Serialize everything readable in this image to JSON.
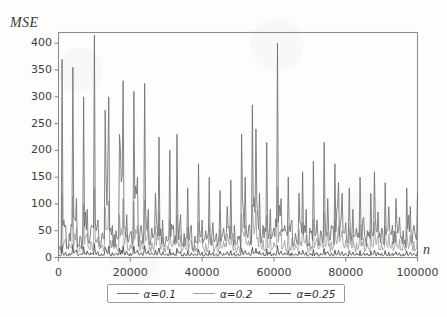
{
  "chart_data": {
    "type": "line",
    "title": "",
    "subtitle": "",
    "xlabel": "n",
    "ylabel": "MSE",
    "xlim": [
      0,
      100000
    ],
    "ylim": [
      0,
      420
    ],
    "grid": false,
    "legend_position": "below-axes",
    "xticks": [
      0,
      20000,
      40000,
      60000,
      80000,
      100000
    ],
    "xtick_labels": [
      "0",
      "20000",
      "40000",
      "60000",
      "80000",
      "100000"
    ],
    "yticks": [
      0,
      50,
      100,
      150,
      200,
      250,
      300,
      350,
      400
    ],
    "ytick_labels": [
      "0",
      "50",
      "100",
      "150",
      "200",
      "250",
      "300",
      "350",
      "400"
    ],
    "series": [
      {
        "name": "α=0.1",
        "color": "#6f6f6f",
        "x": [
          0,
          1000,
          2000,
          3000,
          4000,
          5000,
          6000,
          7000,
          8000,
          9000,
          10000,
          11000,
          12000,
          13000,
          14000,
          15000,
          16000,
          17000,
          18000,
          19000,
          20000,
          21000,
          22000,
          23000,
          24000,
          25000,
          26000,
          27000,
          28000,
          29000,
          30000,
          31000,
          32000,
          33000,
          34000,
          35000,
          36000,
          37000,
          38000,
          39000,
          40000,
          41000,
          42000,
          43000,
          44000,
          45000,
          46000,
          47000,
          48000,
          49000,
          50000,
          51000,
          52000,
          53000,
          54000,
          55000,
          56000,
          57000,
          58000,
          59000,
          60000,
          61000,
          62000,
          63000,
          64000,
          65000,
          66000,
          67000,
          68000,
          69000,
          70000,
          71000,
          72000,
          73000,
          74000,
          75000,
          76000,
          77000,
          78000,
          79000,
          80000,
          81000,
          82000,
          83000,
          84000,
          85000,
          86000,
          87000,
          88000,
          89000,
          90000,
          91000,
          92000,
          93000,
          94000,
          95000,
          96000,
          97000,
          98000,
          99000,
          100000
        ],
        "values": [
          20,
          370,
          60,
          45,
          355,
          110,
          40,
          300,
          90,
          55,
          415,
          70,
          40,
          275,
          300,
          60,
          50,
          230,
          330,
          80,
          45,
          310,
          150,
          60,
          325,
          90,
          55,
          120,
          225,
          70,
          40,
          200,
          60,
          230,
          80,
          45,
          130,
          60,
          40,
          175,
          70,
          50,
          150,
          65,
          45,
          125,
          55,
          95,
          145,
          60,
          40,
          230,
          150,
          60,
          285,
          240,
          120,
          60,
          215,
          90,
          55,
          400,
          110,
          60,
          150,
          70,
          45,
          120,
          160,
          90,
          55,
          180,
          70,
          50,
          215,
          110,
          60,
          175,
          140,
          120,
          65,
          130,
          90,
          55,
          150,
          75,
          50,
          120,
          160,
          85,
          55,
          140,
          95,
          60,
          110,
          75,
          50,
          130,
          95,
          60,
          120
        ]
      },
      {
        "name": "α=0.2",
        "color": "#a0a0a0",
        "x": [
          0,
          1000,
          2000,
          3000,
          4000,
          5000,
          6000,
          7000,
          8000,
          9000,
          10000,
          11000,
          12000,
          13000,
          14000,
          15000,
          16000,
          17000,
          18000,
          19000,
          20000,
          21000,
          22000,
          23000,
          24000,
          25000,
          26000,
          27000,
          28000,
          29000,
          30000,
          31000,
          32000,
          33000,
          34000,
          35000,
          36000,
          37000,
          38000,
          39000,
          40000,
          41000,
          42000,
          43000,
          44000,
          45000,
          46000,
          47000,
          48000,
          49000,
          50000,
          51000,
          52000,
          53000,
          54000,
          55000,
          56000,
          57000,
          58000,
          59000,
          60000,
          61000,
          62000,
          63000,
          64000,
          65000,
          66000,
          67000,
          68000,
          69000,
          70000,
          71000,
          72000,
          73000,
          74000,
          75000,
          76000,
          77000,
          78000,
          79000,
          80000,
          81000,
          82000,
          83000,
          84000,
          85000,
          86000,
          87000,
          88000,
          89000,
          90000,
          91000,
          92000,
          93000,
          94000,
          95000,
          96000,
          97000,
          98000,
          99000,
          100000
        ],
        "values": [
          10,
          120,
          35,
          25,
          115,
          55,
          22,
          100,
          45,
          30,
          130,
          38,
          22,
          95,
          105,
          32,
          26,
          80,
          110,
          42,
          24,
          105,
          60,
          32,
          108,
          48,
          28,
          58,
          85,
          38,
          22,
          72,
          32,
          80,
          42,
          25,
          58,
          32,
          22,
          66,
          36,
          26,
          60,
          34,
          24,
          52,
          30,
          44,
          58,
          32,
          22,
          82,
          60,
          32,
          98,
          86,
          52,
          32,
          78,
          44,
          28,
          132,
          52,
          32,
          60,
          36,
          24,
          52,
          66,
          42,
          28,
          72,
          36,
          26,
          84,
          48,
          30,
          70,
          58,
          50,
          32,
          56,
          42,
          28,
          62,
          36,
          26,
          52,
          66,
          40,
          28,
          58,
          44,
          30,
          48,
          34,
          26,
          54,
          42,
          30,
          50
        ]
      },
      {
        "name": "α=0.25",
        "color": "#4d4d4d",
        "x": [
          0,
          1000,
          2000,
          3000,
          4000,
          5000,
          6000,
          7000,
          8000,
          9000,
          10000,
          11000,
          12000,
          13000,
          14000,
          15000,
          16000,
          17000,
          18000,
          19000,
          20000,
          21000,
          22000,
          23000,
          24000,
          25000,
          26000,
          27000,
          28000,
          29000,
          30000,
          31000,
          32000,
          33000,
          34000,
          35000,
          36000,
          37000,
          38000,
          39000,
          40000,
          41000,
          42000,
          43000,
          44000,
          45000,
          46000,
          47000,
          48000,
          49000,
          50000,
          51000,
          52000,
          53000,
          54000,
          55000,
          56000,
          57000,
          58000,
          59000,
          60000,
          61000,
          62000,
          63000,
          64000,
          65000,
          66000,
          67000,
          68000,
          69000,
          70000,
          71000,
          72000,
          73000,
          74000,
          75000,
          76000,
          77000,
          78000,
          79000,
          80000,
          81000,
          82000,
          83000,
          84000,
          85000,
          86000,
          87000,
          88000,
          89000,
          90000,
          91000,
          92000,
          93000,
          94000,
          95000,
          96000,
          97000,
          98000,
          99000,
          100000
        ],
        "values": [
          5,
          22,
          10,
          8,
          24,
          14,
          7,
          20,
          12,
          9,
          26,
          11,
          7,
          19,
          21,
          9,
          8,
          17,
          22,
          12,
          8,
          21,
          14,
          9,
          22,
          13,
          8,
          14,
          18,
          10,
          7,
          16,
          9,
          17,
          11,
          8,
          13,
          9,
          7,
          15,
          10,
          8,
          13,
          9,
          7,
          12,
          8,
          11,
          13,
          9,
          7,
          17,
          13,
          9,
          19,
          17,
          12,
          9,
          16,
          11,
          8,
          22,
          12,
          9,
          13,
          9,
          7,
          12,
          14,
          10,
          8,
          15,
          9,
          8,
          17,
          11,
          8,
          14,
          13,
          11,
          8,
          13,
          10,
          8,
          13,
          9,
          8,
          12,
          14,
          10,
          8,
          13,
          10,
          8,
          11,
          9,
          7,
          12,
          10,
          8,
          11
        ]
      }
    ]
  },
  "axes": {
    "frame_color": "#8c8c8c",
    "tick_color": "#8c8c8c"
  },
  "legend": {
    "entries": [
      {
        "label": "α=0.1",
        "color": "#6f6f6f"
      },
      {
        "label": "α=0.2",
        "color": "#a0a0a0"
      },
      {
        "label": "α=0.25",
        "color": "#4d4d4d"
      }
    ]
  }
}
